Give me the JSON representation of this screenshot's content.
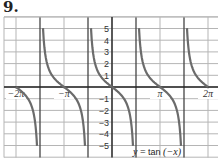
{
  "problem_number": "9.",
  "chart_data": {
    "type": "line",
    "title": "",
    "equation_label": "y = tan (−x)",
    "equation_parts": {
      "lhs": "y",
      "eq": " = ",
      "fn": "tan ",
      "arg": "(−x)"
    },
    "xlabel": "",
    "ylabel": "",
    "x_range": [
      -6.6,
      6.9
    ],
    "ylim": [
      -6,
      6
    ],
    "x_tick_labels": [
      {
        "label": "−2π",
        "value": -6.2832
      },
      {
        "label": "−π",
        "value": -3.1416
      },
      {
        "label": "π",
        "value": 3.1416
      },
      {
        "label": "2π",
        "value": 6.2832
      }
    ],
    "y_tick_labels": [
      "5",
      "4",
      "3",
      "2",
      "1",
      "−1",
      "−2",
      "−3",
      "−4",
      "−5"
    ],
    "y_tick_values": [
      5,
      4,
      3,
      2,
      1,
      -1,
      -2,
      -3,
      -4,
      -5
    ],
    "grid": true,
    "grid_x_step": "π/2",
    "grid_y_step": 1,
    "asymptotes": [
      "-3π/2",
      "-π/2",
      "π/2",
      "3π/2"
    ],
    "series": [
      {
        "name": "tan(-x)",
        "color": "#6b6b6b",
        "branches": [
          {
            "x_from": -6.2832,
            "x_to": -4.9087,
            "y_from": 0,
            "y_to": -5
          },
          {
            "x_from": -4.5161,
            "x_to": -1.7671,
            "y_from": 5,
            "y_to": -5
          },
          {
            "x_from": -1.3745,
            "x_to": 1.3745,
            "y_from": 5,
            "y_to": -5
          },
          {
            "x_from": 1.7671,
            "x_to": 4.5161,
            "y_from": 5,
            "y_to": -5
          },
          {
            "x_from": 4.9087,
            "x_to": 6.2832,
            "y_from": 5,
            "y_to": 0
          }
        ]
      }
    ]
  },
  "colors": {
    "grid": "#b5b5b5",
    "major_grid": "#444444",
    "axis": "#222222",
    "curve": "#6b6b6b",
    "background": "#ffffff"
  }
}
